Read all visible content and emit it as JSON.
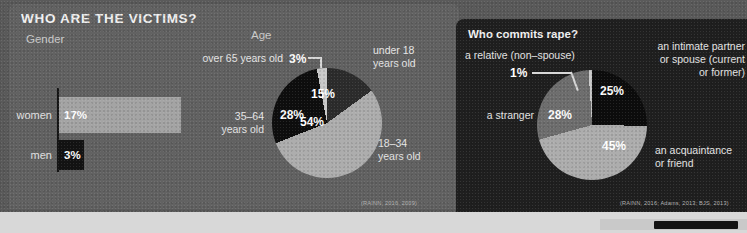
{
  "infographic": {
    "title": "WHO ARE THE VICTIMS?",
    "right_panel_title": "Who commits rape?",
    "sections": {
      "gender_label": "Gender",
      "age_label": "Age"
    },
    "colors": {
      "background": "#5a5a5a",
      "card_left": "#626262",
      "card_right": "#1f1f1f",
      "slice_dark": "#2a2a2a",
      "slice_black": "#101010",
      "slice_mid": "#6e6e6e",
      "slice_light": "#adadad",
      "slice_pale": "#c9c9c9",
      "bar_light": "#a4a4a4",
      "bar_black": "#131313",
      "text": "#f2f2f2"
    }
  },
  "chart_data": [
    {
      "type": "bar",
      "title": "Gender",
      "orientation": "horizontal",
      "categories": [
        "women",
        "men"
      ],
      "values": [
        17,
        3
      ],
      "value_labels": [
        "17%",
        "3%"
      ],
      "colors": [
        "#a4a4a4",
        "#131313"
      ],
      "xlabel": "",
      "ylabel": "",
      "xlim": [
        0,
        20
      ],
      "grid": false,
      "legend": "none"
    },
    {
      "type": "pie",
      "title": "Age",
      "categories": [
        "under 18 years old",
        "18–34 years old",
        "35–64 years old",
        "over 65 years old"
      ],
      "values": [
        15,
        54,
        28,
        3
      ],
      "value_labels": [
        "15%",
        "54%",
        "28%",
        "3%"
      ],
      "colors": [
        "#2c2c2c",
        "#adadad",
        "#0e0e0e",
        "#c9c9c9"
      ],
      "source": "(RAINN, 2016, 2009)",
      "legend": "callout-labels"
    },
    {
      "type": "pie",
      "title": "Who commits rape?",
      "categories": [
        "an intimate partner or spouse (current or former)",
        "an acquaintance or friend",
        "a stranger",
        "a relative (non–spouse)"
      ],
      "values": [
        25,
        45,
        28,
        1
      ],
      "value_labels": [
        "25%",
        "45%",
        "28%",
        "1%"
      ],
      "colors": [
        "#0c0c0c",
        "#adadad",
        "#6e6e6e",
        "#c9c9c9"
      ],
      "source": "(RAINN, 2016; Adams, 2013; BJS, 2013)",
      "legend": "callout-labels"
    }
  ],
  "age_chart": {
    "pct_under18": "15%",
    "pct_18_34": "54%",
    "pct_35_64": "28%",
    "pct_over65": "3%",
    "cat_under18_line1": "under 18",
    "cat_under18_line2": "years old",
    "cat_18_34_line1": "18–34",
    "cat_18_34_line2": "years old",
    "cat_35_64_line1": "35–64",
    "cat_35_64_line2": "years old",
    "cat_over65": "over 65 years old",
    "source": "(RAINN, 2016, 2009)"
  },
  "perp_chart": {
    "pct_partner": "25%",
    "pct_acquaintance": "45%",
    "pct_stranger": "28%",
    "pct_relative": "1%",
    "cat_partner_line1": "an intimate partner",
    "cat_partner_line2": "or spouse (current",
    "cat_partner_line3": "or former)",
    "cat_acquaintance_line1": "an acquaintance",
    "cat_acquaintance_line2": "or friend",
    "cat_stranger": "a stranger",
    "cat_relative": "a relative (non–spouse)",
    "source": "(RAINN, 2016; Adams, 2013; BJS, 2013)"
  },
  "gender_chart": {
    "label_women": "women",
    "label_men": "men",
    "value_women": "17%",
    "value_men": "3%"
  }
}
